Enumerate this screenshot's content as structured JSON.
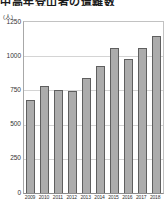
{
  "title": "中高年登山者の遭難数",
  "y_axis": {
    "unit": "(人)",
    "ticks": [
      0,
      250,
      500,
      750,
      1000,
      1250
    ],
    "max": 1250
  },
  "chart_data": {
    "type": "bar",
    "title": "中高年登山者の遭難数",
    "categories": [
      "2009",
      "2010",
      "2011",
      "2012",
      "2013",
      "2014",
      "2015",
      "2016",
      "2017",
      "2018"
    ],
    "values": [
      680,
      780,
      755,
      745,
      840,
      930,
      1060,
      980,
      1060,
      1150
    ],
    "xlabel": "",
    "ylabel": "(人)",
    "ylim": [
      0,
      1250
    ],
    "grid": true,
    "legend": "none",
    "colors": {
      "bar_fill": "#acacac",
      "bar_border": "#5f5f5f",
      "gridline": "#d4d4d4",
      "plot_border": "#c2c2c2",
      "text": "#333333",
      "background": "#ffffff"
    }
  }
}
